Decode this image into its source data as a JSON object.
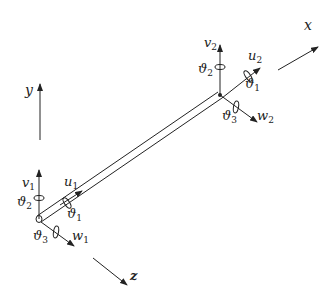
{
  "diagram": {
    "colors": {
      "stroke": "#222222",
      "background": "#ffffff"
    },
    "global_axes": [
      {
        "id": "x",
        "label": "x"
      },
      {
        "id": "y",
        "label": "y"
      },
      {
        "id": "z",
        "label": "z"
      }
    ],
    "node1": {
      "v": {
        "base": "v",
        "sub": "1"
      },
      "u": {
        "base": "u",
        "sub": "1"
      },
      "w": {
        "base": "w",
        "sub": "1"
      },
      "theta_v": {
        "base": "ϑ",
        "sub": "2"
      },
      "theta_u": {
        "base": "ϑ",
        "sub": "1"
      },
      "theta_w": {
        "base": "ϑ",
        "sub": "3"
      }
    },
    "node2": {
      "v": {
        "base": "v",
        "sub": "2"
      },
      "u": {
        "base": "u",
        "sub": "2"
      },
      "w": {
        "base": "w",
        "sub": "2"
      },
      "theta_v": {
        "base": "ϑ",
        "sub": "2"
      },
      "theta_u": {
        "base": "ϑ",
        "sub": "1"
      },
      "theta_w": {
        "base": "ϑ",
        "sub": "3"
      }
    }
  }
}
